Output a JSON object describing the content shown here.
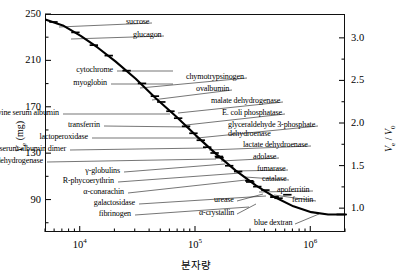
{
  "chart_data": {
    "type": "line",
    "title": "",
    "xlabel": "분자량",
    "ylabel_left": "Vₑ (mg)",
    "ylabel_right": "Vₑ / V₀",
    "xscale": "log",
    "xlim": [
      5000,
      2000000
    ],
    "ylim_left": [
      62,
      250
    ],
    "ylim_right": [
      0.72,
      3.28
    ],
    "grid": false,
    "legend": false,
    "x_ticks": [
      {
        "value": 10000,
        "label": "10⁴"
      },
      {
        "value": 100000,
        "label": "10⁵"
      },
      {
        "value": 1000000,
        "label": "10⁶"
      }
    ],
    "y_ticks_left": [
      {
        "value": 250,
        "label": "250"
      },
      {
        "value": 230,
        "label": ""
      },
      {
        "value": 210,
        "label": "210"
      },
      {
        "value": 190,
        "label": ""
      },
      {
        "value": 170,
        "label": "170"
      },
      {
        "value": 150,
        "label": ""
      },
      {
        "value": 130,
        "label": "130"
      },
      {
        "value": 110,
        "label": ""
      },
      {
        "value": 90,
        "label": "90"
      },
      {
        "value": 70,
        "label": ""
      }
    ],
    "y_ticks_right": [
      {
        "value": 3.0,
        "label": "3.0"
      },
      {
        "value": 2.75,
        "label": ""
      },
      {
        "value": 2.5,
        "label": "2.5"
      },
      {
        "value": 2.25,
        "label": ""
      },
      {
        "value": 2.0,
        "label": "2.0"
      },
      {
        "value": 1.75,
        "label": ""
      },
      {
        "value": 1.5,
        "label": "1.5"
      },
      {
        "value": 1.25,
        "label": ""
      },
      {
        "value": 1.0,
        "label": "1.0"
      }
    ],
    "curve_color": "#000000",
    "curve": [
      {
        "mw": 5000,
        "ve": 246
      },
      {
        "mw": 7000,
        "ve": 241
      },
      {
        "mw": 10000,
        "ve": 232
      },
      {
        "mw": 14000,
        "ve": 222
      },
      {
        "mw": 20000,
        "ve": 210
      },
      {
        "mw": 30000,
        "ve": 195
      },
      {
        "mw": 45000,
        "ve": 178
      },
      {
        "mw": 68000,
        "ve": 162
      },
      {
        "mw": 100000,
        "ve": 146
      },
      {
        "mw": 150000,
        "ve": 130
      },
      {
        "mw": 220000,
        "ve": 116
      },
      {
        "mw": 330000,
        "ve": 103
      },
      {
        "mw": 480000,
        "ve": 93
      },
      {
        "mw": 700000,
        "ve": 85
      },
      {
        "mw": 1000000,
        "ve": 80
      },
      {
        "mw": 1400000,
        "ve": 78
      },
      {
        "mw": 2000000,
        "ve": 78
      }
    ],
    "points": [
      {
        "name": "sucrose",
        "mw": 5800,
        "ve": 244
      },
      {
        "name": "glucagon",
        "mw": 9000,
        "ve": 235
      },
      {
        "name": "cytochrome",
        "mw": 13000,
        "ve": 224
      },
      {
        "name": "myoglobin",
        "mw": 17500,
        "ve": 215
      },
      {
        "name": "chymotrypsinogen",
        "mw": 25000,
        "ve": 202
      },
      {
        "name": "ovalbumin",
        "mw": 34000,
        "ve": 191
      },
      {
        "name": "bovine serum albumin",
        "mw": 44000,
        "ve": 180
      },
      {
        "name": "malate dehydrogenase",
        "mw": 50000,
        "ve": 175
      },
      {
        "name": "transferrin",
        "mw": 60000,
        "ve": 167
      },
      {
        "name": "E. coli phosphatase",
        "mw": 70000,
        "ve": 161
      },
      {
        "name": "lactoperoxidase",
        "mw": 82000,
        "ve": 154
      },
      {
        "name": "glyceraldehyde 3-phosphate dehydroenase",
        "mw": 95000,
        "ve": 148
      },
      {
        "name": "serum albumin dimer",
        "mw": 110000,
        "ve": 142
      },
      {
        "name": "lactate dehydroenase",
        "mw": 125000,
        "ve": 136
      },
      {
        "name": "yeast alcohol dehydrogenase",
        "mw": 145000,
        "ve": 131
      },
      {
        "name": "adolase",
        "mw": 158000,
        "ve": 128
      },
      {
        "name": "γ-globulins",
        "mw": 160000,
        "ve": 127
      },
      {
        "name": "fumarase",
        "mw": 194000,
        "ve": 120
      },
      {
        "name": "R-phycoerythrin",
        "mw": 290000,
        "ve": 107
      },
      {
        "name": "catalase",
        "mw": 232000,
        "ve": 115
      },
      {
        "name": "α-conarachin",
        "mw": 295000,
        "ve": 106
      },
      {
        "name": "urease",
        "mw": 480000,
        "ve": 93
      },
      {
        "name": "apoferritin",
        "mw": 480000,
        "ve": 93
      },
      {
        "name": "galactosidase",
        "mw": 520000,
        "ve": 92
      },
      {
        "name": "ferritin",
        "mw": 620000,
        "ve": 95
      },
      {
        "name": "fibrinogen",
        "mw": 340000,
        "ve": 102
      },
      {
        "name": "α-crystallin",
        "mw": 400000,
        "ve": 99
      },
      {
        "name": "blue dextran",
        "mw": 1800000,
        "ve": 78
      }
    ],
    "annotations": [
      {
        "text": "sucrose",
        "side": "left",
        "tx": 126,
        "ty": 18,
        "px": 58,
        "py": 26
      },
      {
        "text": "glucagon",
        "side": "left",
        "tx": 133,
        "ty": 31,
        "px": 70,
        "py": 38
      },
      {
        "text": "cytochrome",
        "side": "right",
        "tx": 113,
        "ty": 66,
        "px": 172,
        "py": 70
      },
      {
        "text": "myoglobin",
        "side": "right",
        "tx": 107,
        "ty": 79,
        "px": 172,
        "py": 83
      },
      {
        "text": "chymotrypsinogen",
        "side": "left",
        "tx": 186,
        "ty": 73,
        "px": 139,
        "py": 87
      },
      {
        "text": "ovalbumin",
        "side": "left",
        "tx": 196,
        "ty": 85,
        "px": 151,
        "py": 99
      },
      {
        "text": "bovine serum albumin",
        "side": "right",
        "tx": 59,
        "ty": 109,
        "px": 169,
        "py": 113
      },
      {
        "text": "malate dehydrogenase",
        "side": "left",
        "tx": 211,
        "ty": 97,
        "px": 177,
        "py": 112
      },
      {
        "text": "E. coli phosphatase",
        "side": "left",
        "tx": 222,
        "ty": 109,
        "px": 185,
        "py": 124
      },
      {
        "text": "transferrin",
        "side": "right",
        "tx": 100,
        "ty": 121,
        "px": 189,
        "py": 126
      },
      {
        "text": "glyceraldehyde 3-phosphate",
        "side": "left",
        "tx": 228,
        "ty": 121,
        "px": 196,
        "py": 137
      },
      {
        "text": "dehydroenase",
        "side": "none",
        "tx": 228,
        "ty": 130,
        "px": 0,
        "py": 0
      },
      {
        "text": "lactoperoxidase",
        "side": "right",
        "tx": 88,
        "ty": 133,
        "px": 197,
        "py": 137
      },
      {
        "text": "serum albumin dimer",
        "side": "right",
        "tx": 66,
        "ty": 145,
        "px": 205,
        "py": 147
      },
      {
        "text": "lactate dehydroenase",
        "side": "left",
        "tx": 243,
        "ty": 141,
        "px": 208,
        "py": 149
      },
      {
        "text": "yeast alcohol dehydrogenase",
        "side": "right",
        "tx": 43,
        "ty": 157,
        "px": 215,
        "py": 158
      },
      {
        "text": "adolase",
        "side": "left",
        "tx": 253,
        "ty": 153,
        "px": 220,
        "py": 160
      },
      {
        "text": "γ-globulins",
        "side": "right",
        "tx": 120,
        "ty": 167,
        "px": 224,
        "py": 163
      },
      {
        "text": "fumarase",
        "side": "left",
        "tx": 257,
        "ty": 165,
        "px": 234,
        "py": 170
      },
      {
        "text": "R-phycoerythrin",
        "side": "right",
        "tx": 114,
        "ty": 177,
        "px": 240,
        "py": 172
      },
      {
        "text": "catalase",
        "side": "left",
        "tx": 262,
        "ty": 175,
        "px": 244,
        "py": 176
      },
      {
        "text": "α-conarachin",
        "side": "right",
        "tx": 124,
        "ty": 188,
        "px": 245,
        "py": 179
      },
      {
        "text": "apoferritin",
        "side": "left",
        "tx": 277,
        "ty": 186,
        "px": 258,
        "py": 191
      },
      {
        "text": "urease",
        "side": "left",
        "tx": 214,
        "ty": 196,
        "px": 262,
        "py": 193
      },
      {
        "text": "galactosidase",
        "side": "right",
        "tx": 135,
        "ty": 199,
        "px": 265,
        "py": 195
      },
      {
        "text": "ferritin",
        "side": "left",
        "tx": 292,
        "ty": 196,
        "px": 273,
        "py": 194
      },
      {
        "text": "fibrinogen",
        "side": "right",
        "tx": 131,
        "ty": 210,
        "px": 248,
        "py": 206
      },
      {
        "text": "α-crystallin",
        "side": "left",
        "tx": 199,
        "ty": 209,
        "px": 255,
        "py": 203
      },
      {
        "text": "blue dextran",
        "side": "left",
        "tx": 254,
        "ty": 219,
        "px": 318,
        "py": 213
      }
    ]
  }
}
